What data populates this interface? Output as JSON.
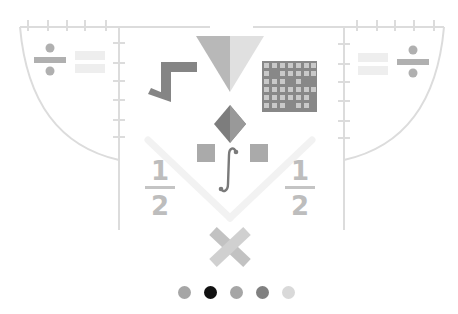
{
  "illustration": {
    "left_panel": {
      "operator": "÷",
      "equals": "="
    },
    "right_panel": {
      "operator": "÷",
      "equals": "="
    },
    "fraction_left": {
      "numerator": "1",
      "denominator": "2"
    },
    "fraction_right": {
      "numerator": "1",
      "denominator": "2"
    },
    "center_symbol": "∫",
    "multiply_symbol": "×"
  },
  "carousel": {
    "active_index": 1,
    "dots": [
      {
        "label": "Slide 1",
        "color": "#a6a6a6"
      },
      {
        "label": "Slide 2",
        "color": "#111111"
      },
      {
        "label": "Slide 3",
        "color": "#a6a6a6"
      },
      {
        "label": "Slide 4",
        "color": "#808080"
      },
      {
        "label": "Slide 5",
        "color": "#d9d9d9"
      }
    ]
  },
  "colors": {
    "line": "#dcdcdc",
    "dark_gray": "#858585",
    "mid_gray": "#ababab",
    "light_gray": "#e6e6e6"
  }
}
